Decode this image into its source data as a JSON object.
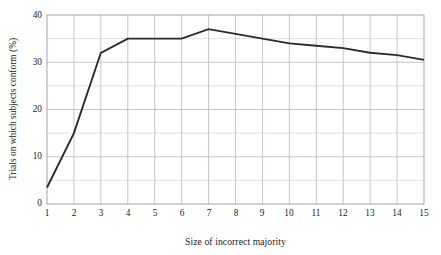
{
  "chart_data": {
    "type": "line",
    "title": "",
    "xlabel": "Size of incorrect majority",
    "ylabel": "Trials on which subjects conform (%)",
    "x": [
      1,
      2,
      3,
      4,
      5,
      6,
      7,
      8,
      9,
      10,
      11,
      12,
      13,
      14,
      15
    ],
    "values": [
      3.5,
      15.0,
      32.0,
      35.0,
      35.0,
      35.0,
      37.0,
      36.0,
      35.0,
      34.0,
      33.5,
      33.0,
      32.0,
      31.5,
      30.5
    ],
    "series": [
      {
        "name": "Trials on which subjects conform",
        "values": [
          3.5,
          15.0,
          32.0,
          35.0,
          35.0,
          35.0,
          37.0,
          36.0,
          35.0,
          34.0,
          33.5,
          33.0,
          32.0,
          31.5,
          30.5
        ]
      }
    ],
    "xlim": [
      1,
      15
    ],
    "ylim": [
      0,
      40
    ],
    "xticks": [
      "1",
      "2",
      "3",
      "4",
      "5",
      "6",
      "7",
      "8",
      "9",
      "10",
      "11",
      "12",
      "13",
      "14",
      "15"
    ],
    "yticks": [
      "0",
      "10",
      "20",
      "30",
      "40"
    ],
    "y_minor_ticks": [
      5,
      15,
      25,
      35
    ],
    "grid": true,
    "legend": "none",
    "line_color": "#2b2b2b",
    "grid_color": "#b8b8c4",
    "minor_grid_color": "#dcdce4",
    "frame_color": "#9a9aa8",
    "background": "#ffffff"
  }
}
